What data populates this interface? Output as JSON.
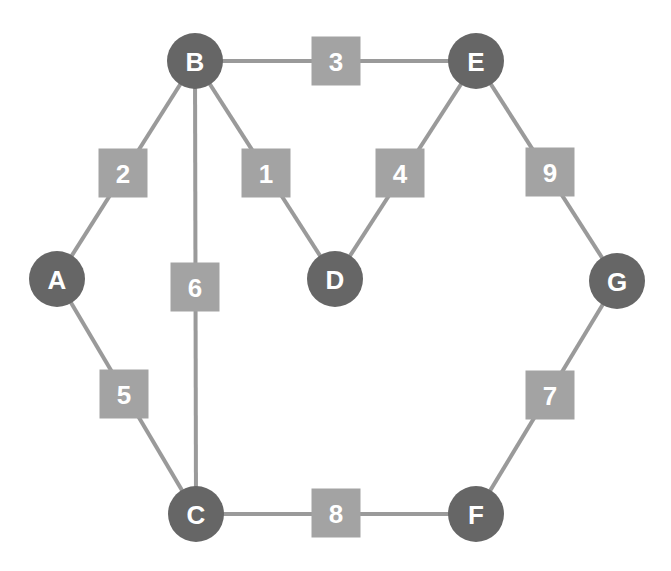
{
  "graph": {
    "colors": {
      "background": "#ffffff",
      "node_fill": "#666666",
      "edge": "#9a9a9a",
      "weight_box": "#a3a3a3",
      "label_text": "#ffffff"
    },
    "nodes": [
      {
        "id": "A",
        "label": "A",
        "x": 57,
        "y": 279
      },
      {
        "id": "B",
        "label": "B",
        "x": 195,
        "y": 61
      },
      {
        "id": "C",
        "label": "C",
        "x": 196,
        "y": 514
      },
      {
        "id": "D",
        "label": "D",
        "x": 335,
        "y": 279
      },
      {
        "id": "E",
        "label": "E",
        "x": 476,
        "y": 61
      },
      {
        "id": "F",
        "label": "F",
        "x": 476,
        "y": 514
      },
      {
        "id": "G",
        "label": "G",
        "x": 617,
        "y": 281
      }
    ],
    "edges": [
      {
        "from": "A",
        "to": "B",
        "weight": "2",
        "box_x": 123,
        "box_y": 173
      },
      {
        "from": "B",
        "to": "E",
        "weight": "3",
        "box_x": 336,
        "box_y": 61
      },
      {
        "from": "B",
        "to": "D",
        "weight": "1",
        "box_x": 266,
        "box_y": 173
      },
      {
        "from": "D",
        "to": "E",
        "weight": "4",
        "box_x": 400,
        "box_y": 173
      },
      {
        "from": "A",
        "to": "C",
        "weight": "5",
        "box_x": 124,
        "box_y": 394
      },
      {
        "from": "B",
        "to": "C",
        "weight": "6",
        "box_x": 195,
        "box_y": 287
      },
      {
        "from": "F",
        "to": "G",
        "weight": "7",
        "box_x": 550,
        "box_y": 395
      },
      {
        "from": "C",
        "to": "F",
        "weight": "8",
        "box_x": 336,
        "box_y": 513
      },
      {
        "from": "E",
        "to": "G",
        "weight": "9",
        "box_x": 550,
        "box_y": 172
      }
    ]
  }
}
